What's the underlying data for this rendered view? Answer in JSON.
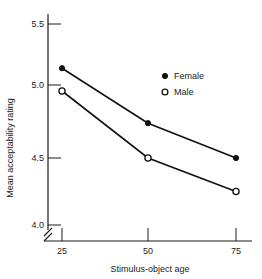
{
  "chart_data": {
    "type": "line",
    "title": "",
    "xlabel": "Stimulus-object age",
    "ylabel": "Mean acceptability rating",
    "x": [
      25,
      50,
      75
    ],
    "categories": [
      "25",
      "50",
      "75"
    ],
    "xtick_labels": [
      "25",
      "50",
      "75"
    ],
    "ytick_labels": [
      "4.0",
      "4.5",
      "5.0",
      "5.5"
    ],
    "ytick_values": [
      4.0,
      4.5,
      5.0,
      5.5
    ],
    "ylim": [
      3.93,
      5.62
    ],
    "xlim": [
      18,
      82
    ],
    "grid": false,
    "axis_break": true,
    "axis_break_axis": "y",
    "legend_position": "center-right",
    "series": [
      {
        "name": "Female",
        "marker": "filled-circle",
        "values": [
          5.17,
          4.76,
          4.5
        ]
      },
      {
        "name": "Male",
        "marker": "open-circle",
        "values": [
          5.0,
          4.5,
          4.25
        ]
      }
    ]
  },
  "legend": {
    "entries": [
      {
        "label": "Female",
        "marker": "filled-circle"
      },
      {
        "label": "Male",
        "marker": "open-circle"
      }
    ]
  },
  "axes": {
    "y_title": "Mean acceptability rating",
    "x_title": "Stimulus-object age",
    "y_ticks": [
      "5.5",
      "5.0",
      "4.5",
      "4.0"
    ],
    "x_ticks": [
      "25",
      "50",
      "75"
    ]
  }
}
